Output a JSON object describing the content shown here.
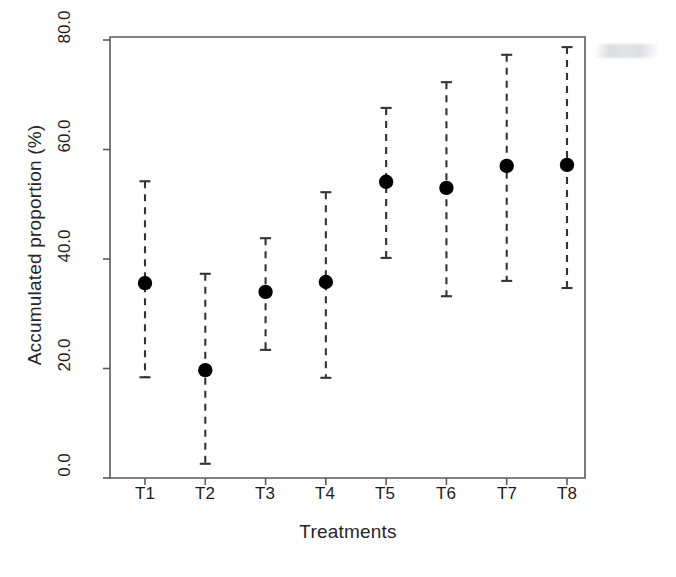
{
  "chart_data": {
    "type": "scatter",
    "title": "",
    "subtitle": "",
    "xlabel": "Treatments",
    "ylabel": "Accumulated proportion (%)",
    "categories": [
      "T1",
      "T2",
      "T3",
      "T4",
      "T5",
      "T6",
      "T7",
      "T8"
    ],
    "values": [
      35.6,
      19.7,
      34.0,
      35.8,
      54.1,
      53.0,
      57.0,
      57.2
    ],
    "error_upper": [
      54.2,
      37.3,
      43.8,
      52.2,
      67.6,
      72.3,
      77.3,
      78.7
    ],
    "error_lower": [
      18.4,
      2.6,
      23.4,
      18.3,
      40.2,
      33.2,
      36.0,
      34.7
    ],
    "series": [
      {
        "name": "Accumulated proportion",
        "points": [
          {
            "x": "T1",
            "mean": 35.6,
            "upper": 54.2,
            "lower": 18.4
          },
          {
            "x": "T2",
            "mean": 19.7,
            "upper": 37.3,
            "lower": 2.6
          },
          {
            "x": "T3",
            "mean": 34.0,
            "upper": 43.8,
            "lower": 23.4
          },
          {
            "x": "T4",
            "mean": 35.8,
            "upper": 52.2,
            "lower": 18.3
          },
          {
            "x": "T5",
            "mean": 54.1,
            "upper": 67.6,
            "lower": 40.2
          },
          {
            "x": "T6",
            "mean": 53.0,
            "upper": 72.3,
            "lower": 33.2
          },
          {
            "x": "T7",
            "mean": 57.0,
            "upper": 77.3,
            "lower": 36.0
          },
          {
            "x": "T8",
            "mean": 57.2,
            "upper": 78.7,
            "lower": 34.7
          }
        ]
      }
    ],
    "ylim": [
      0.0,
      80.0
    ],
    "ytick_labels": [
      "0.0",
      "20.0",
      "40.0",
      "60.0",
      "80.0"
    ],
    "ytick_values": [
      0.0,
      20.0,
      40.0,
      60.0,
      80.0
    ],
    "grid": false,
    "legend": false,
    "legend_position": "none",
    "marker": "filled-circle",
    "errorbar_style": "dashed",
    "colors": {
      "marker": "#000000",
      "errorbar": "#333333",
      "axis": "#555555",
      "text": "#1c1c1c",
      "background": "#ffffff"
    }
  }
}
